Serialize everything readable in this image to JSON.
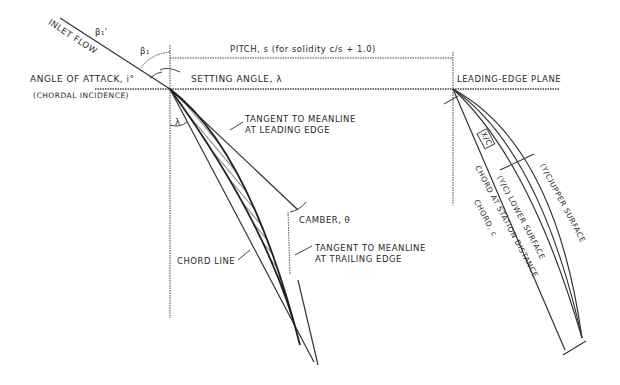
{
  "diagram": {
    "type": "compressor-blade-cascade-geometry",
    "colors": {
      "line": "#333333",
      "background": "#ffffff",
      "text": "#2a2a2a"
    },
    "labels": {
      "inlet_flow": "INLET FLOW",
      "beta1_prime": "β₁'",
      "beta1": "β₁",
      "angle_of_attack": "ANGLE OF ATTACK, i°",
      "chordal_incidence": "(CHORDAL INCIDENCE)",
      "pitch": "PITCH, s (for solidity  c/s + 1.0)",
      "setting_angle": "SETTING ANGLE, λ",
      "leading_edge_plane": "LEADING-EDGE PLANE",
      "lambda_small": "λ",
      "tangent_leading_line1": "TANGENT TO MEANLINE",
      "tangent_leading_line2": "AT LEADING EDGE",
      "camber": "CAMBER, θ",
      "tangent_trailing_line1": "TANGENT TO MEANLINE",
      "tangent_trailing_line2": "AT TRAILING EDGE",
      "chord_line": "CHORD LINE",
      "x_over_c": "X/C",
      "yl_lower_surface": "(Y/C) LOWER SURFACE",
      "yu_upper_surface": "(Y/C)UPPER SURFACE",
      "chord_at_station_distance": "CHORD AT STATION DISTANCE",
      "chord_c": "CHORD, c"
    }
  }
}
